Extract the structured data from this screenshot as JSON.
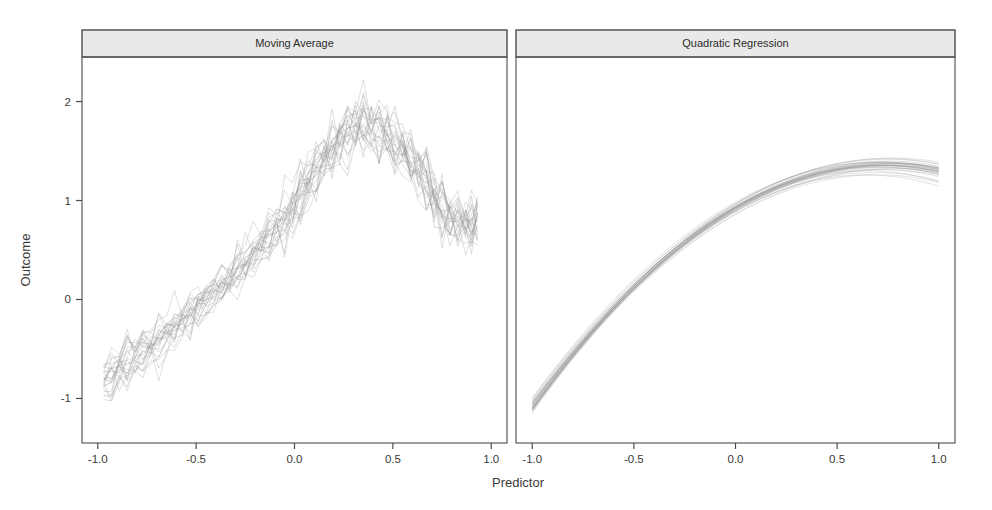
{
  "figure": {
    "width": 992,
    "height": 510,
    "background": "#ffffff",
    "line_color": "#8a8a8a",
    "strip_fill": "#e9e9e9",
    "strip_border": "#4a4a4a",
    "panel_border": "#5a5a5a",
    "axis_color": "#4a4a4a"
  },
  "axis_titles": {
    "x": "Predictor",
    "y": "Outcome"
  },
  "chart_data": {
    "type": "line",
    "title": "",
    "subtitle": "",
    "xlabel": "Predictor",
    "ylabel": "Outcome",
    "xlim": [
      -1.08,
      1.08
    ],
    "ylim": [
      -1.45,
      2.45
    ],
    "grid": false,
    "legend": "none",
    "layout": "trellis-1x2",
    "panels": [
      {
        "label": "Moving Average",
        "xticks": [
          -1.0,
          -0.5,
          0.0,
          0.5,
          1.0
        ],
        "xticklabels": [
          "-1.0",
          "-0.5",
          "0.0",
          "0.5",
          "1.0"
        ],
        "yticks": [
          -1,
          0,
          1,
          2
        ],
        "yticklabels": [
          "-1",
          "0",
          "1",
          "2"
        ],
        "n_curves": 24,
        "x": [
          -0.97,
          -0.89,
          -0.81,
          -0.73,
          -0.65,
          -0.57,
          -0.49,
          -0.41,
          -0.33,
          -0.25,
          -0.17,
          -0.09,
          -0.01,
          0.07,
          0.15,
          0.23,
          0.31,
          0.39,
          0.47,
          0.55,
          0.63,
          0.71,
          0.79,
          0.87,
          0.93
        ],
        "mean_values": [
          -0.82,
          -0.7,
          -0.58,
          -0.46,
          -0.34,
          -0.2,
          -0.06,
          0.08,
          0.22,
          0.38,
          0.56,
          0.74,
          0.92,
          1.18,
          1.42,
          1.62,
          1.74,
          1.76,
          1.68,
          1.54,
          1.32,
          1.02,
          0.8,
          0.78,
          0.86
        ],
        "spread": [
          0.3,
          0.28,
          0.26,
          0.26,
          0.27,
          0.27,
          0.26,
          0.26,
          0.27,
          0.28,
          0.3,
          0.32,
          0.36,
          0.4,
          0.42,
          0.44,
          0.44,
          0.42,
          0.4,
          0.4,
          0.44,
          0.48,
          0.46,
          0.42,
          0.4
        ],
        "note": "noisy, jagged replicate curves with strong vertical scatter at each knot"
      },
      {
        "label": "Quadratic Regression",
        "xticks": [
          -1.0,
          -0.5,
          0.0,
          0.5,
          1.0
        ],
        "xticklabels": [
          "-1.0",
          "-0.5",
          "0.0",
          "0.5",
          "1.0"
        ],
        "yticks": [
          -1,
          0,
          1,
          2
        ],
        "yticklabels": [
          "-1",
          "0",
          "1",
          "2"
        ],
        "n_curves": 30,
        "fit_form": "y = a + b*x + c*x^2",
        "coefficients_mean": {
          "a": 0.92,
          "b": 1.18,
          "c": -0.82
        },
        "coefficients_spread": {
          "a": 0.05,
          "b": 0.06,
          "c": 0.09
        },
        "vertex_x_mean": 0.52,
        "vertex_y_mean": 1.44,
        "endpoint_left": {
          "x": -1.0,
          "y": -1.15
        },
        "endpoint_right": {
          "x": 1.0,
          "y": 1.22
        },
        "note": "smooth concave-down parabolas, tightly bundled, fanning out at both ends"
      }
    ]
  }
}
